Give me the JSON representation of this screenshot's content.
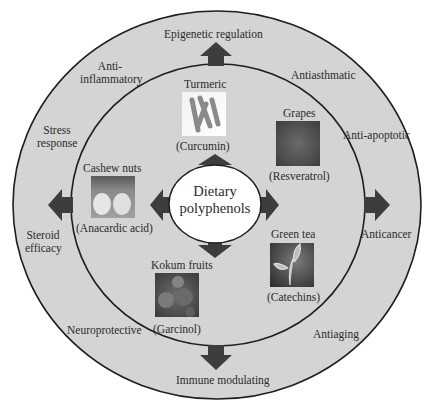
{
  "diagram": {
    "title": "Dietary polyphenols",
    "center": {
      "line1": "Dietary",
      "line2": "polyphenols"
    },
    "colors": {
      "background": "#ffffff",
      "ring_fill": "#d4d4d4",
      "ring_stroke": "#1e1e1e",
      "center_fill": "#ffffff",
      "arrow_fill": "#3d3d3d"
    },
    "sources": [
      {
        "name": "Turmeric",
        "compound": "(Curcumin)"
      },
      {
        "name": "Grapes",
        "compound": "(Resveratrol)"
      },
      {
        "name": "Green tea",
        "compound": "(Catechins)"
      },
      {
        "name": "Kokum fruits",
        "compound": "(Garcinol)"
      },
      {
        "name": "Cashew nuts",
        "compound": "(Anacardic acid)"
      }
    ],
    "effects": {
      "top": "Epigenetic regulation",
      "top_right": "Antiasthmatic",
      "right_upper": "Anti-apoptotic",
      "right": "Anticancer",
      "bottom_right": "Antiaging",
      "bottom": "Immune modulating",
      "bottom_left": "Neuroprotective",
      "left_lower_1": "Steroid",
      "left_lower_2": "efficacy",
      "left_upper_1": "Stress",
      "left_upper_2": "response",
      "top_left_1": "Anti-",
      "top_left_2": "inflammatory"
    }
  }
}
